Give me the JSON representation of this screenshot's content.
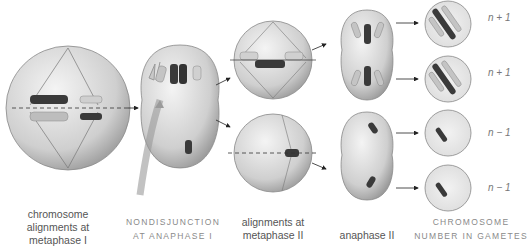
{
  "stages": [
    {
      "id": "metaphase-1",
      "label_lines": [
        "chromosome",
        "alignments at",
        "metaphase I"
      ]
    },
    {
      "id": "nondisjunction",
      "label_lines": [
        "NONDISJUNCTION",
        "AT ANAPHASE I"
      ]
    },
    {
      "id": "metaphase-2",
      "label_lines": [
        "alignments at",
        "metaphase II"
      ]
    },
    {
      "id": "anaphase-2",
      "label_lines": [
        "anaphase II"
      ]
    },
    {
      "id": "gametes",
      "label_lines": [
        "CHROMOSOME",
        "NUMBER IN GAMETES"
      ]
    }
  ],
  "gametes": [
    {
      "count_label": "n + 1"
    },
    {
      "count_label": "n + 1"
    },
    {
      "count_label": "n − 1"
    },
    {
      "count_label": "n − 1"
    }
  ],
  "colors": {
    "cell_fill": "#d9d9d9",
    "chromosome_dark": "#3a3a3a",
    "chromosome_light": "#bdbdbd",
    "label_text": "#555555",
    "caps_text": "#8a8a8a"
  }
}
